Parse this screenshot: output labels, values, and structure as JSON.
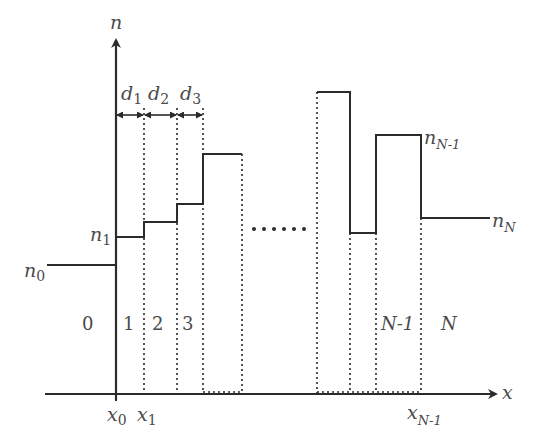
{
  "diagram": {
    "axes": {
      "y_label": "n",
      "x_label": "x"
    },
    "thickness_labels": [
      {
        "base": "d",
        "sub": "1"
      },
      {
        "base": "d",
        "sub": "2"
      },
      {
        "base": "d",
        "sub": "3"
      }
    ],
    "index_labels": {
      "n0": {
        "base": "n",
        "sub": "0"
      },
      "n1": {
        "base": "n",
        "sub": "1"
      },
      "nN1": {
        "base": "n",
        "sub": "N-1"
      },
      "nN": {
        "base": "n",
        "sub": "N"
      }
    },
    "region_labels": [
      "0",
      "1",
      "2",
      "3",
      "N-1",
      "N"
    ],
    "x_ticks": [
      {
        "base": "x",
        "sub": "0"
      },
      {
        "base": "x",
        "sub": "1"
      },
      {
        "base": "x",
        "sub": "N-1"
      }
    ],
    "ellipsis": "......",
    "colors": {
      "line": "#2b2b2b",
      "text": "#4a4a4a",
      "background": "#ffffff"
    }
  }
}
